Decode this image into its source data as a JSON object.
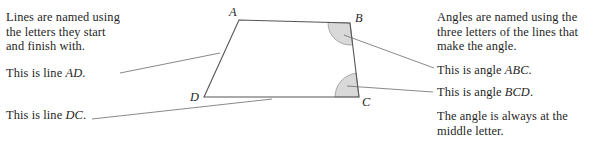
{
  "canvas": {
    "width": 598,
    "height": 142,
    "background": "#ffffff"
  },
  "colors": {
    "text": "#1f1f1f",
    "stroke": "#555555",
    "leader": "#6b6b6b",
    "angle_fill": "#d9d9d9",
    "angle_stroke": "#8a8a8a"
  },
  "left_column": {
    "intro": {
      "line1": "Lines are named using",
      "line2": "the letters they start",
      "line3": "and finish with."
    },
    "line_ad": {
      "prefix": "This is line ",
      "name": "AD",
      "suffix": "."
    },
    "line_dc": {
      "prefix": "This is line ",
      "name": "DC",
      "suffix": "."
    }
  },
  "right_column": {
    "intro": {
      "line1": "Angles are named using the",
      "line2": "three letters of the lines that",
      "line3": "make the angle."
    },
    "angle_abc": {
      "prefix": "This is angle ",
      "name": "ABC",
      "suffix": "."
    },
    "angle_bcd": {
      "prefix": "This is angle ",
      "name": "BCD",
      "suffix": "."
    },
    "note": {
      "line1": "The angle is always at the",
      "line2": "middle letter."
    }
  },
  "figure": {
    "type": "quadrilateral",
    "vertices": [
      {
        "label": "A",
        "x": 239,
        "y": 20
      },
      {
        "label": "B",
        "x": 350,
        "y": 23
      },
      {
        "label": "C",
        "x": 359,
        "y": 97
      },
      {
        "label": "D",
        "x": 204,
        "y": 97
      }
    ],
    "edges": [
      {
        "name": "AB",
        "from": "A",
        "to": "B"
      },
      {
        "name": "BC",
        "from": "B",
        "to": "C"
      },
      {
        "name": "CD",
        "from": "C",
        "to": "D"
      },
      {
        "name": "DA",
        "from": "D",
        "to": "A"
      }
    ],
    "marked_angles": [
      {
        "name": "ABC",
        "vertex": "B",
        "radius": 22
      },
      {
        "name": "BCD",
        "vertex": "C",
        "radius": 24
      }
    ],
    "leaders": [
      {
        "name": "leader-ad",
        "x1": 120,
        "y1": 73,
        "x2": 220,
        "y2": 53
      },
      {
        "name": "leader-dc",
        "x1": 92,
        "y1": 119,
        "x2": 272,
        "y2": 99
      },
      {
        "name": "leader-abc",
        "x1": 344,
        "y1": 35,
        "x2": 434,
        "y2": 68
      },
      {
        "name": "leader-bcd",
        "x1": 347,
        "y1": 86,
        "x2": 433,
        "y2": 92
      }
    ]
  }
}
